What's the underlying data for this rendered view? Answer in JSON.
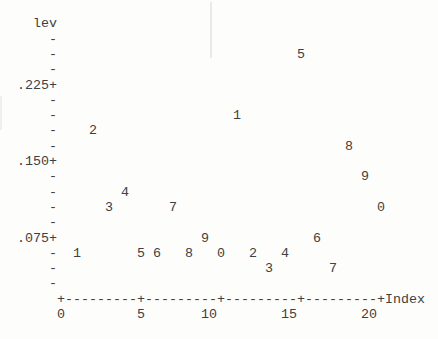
{
  "figure": {
    "background_color": "#fdfdfc",
    "text_color": "#404040"
  },
  "chart_data": {
    "type": "scatter",
    "plot_style": "minitab-character-plot",
    "title": "",
    "ylabel": "lev",
    "xlabel": "Index",
    "x": [
      1,
      2,
      3,
      4,
      5,
      6,
      7,
      8,
      9,
      10,
      11,
      12,
      13,
      14,
      15,
      16,
      17,
      18,
      19,
      20
    ],
    "y": [
      0.06,
      0.18,
      0.105,
      0.12,
      0.06,
      0.06,
      0.105,
      0.06,
      0.075,
      0.06,
      0.195,
      0.06,
      0.045,
      0.06,
      0.255,
      0.075,
      0.045,
      0.165,
      0.135,
      0.105
    ],
    "point_labels": [
      "1",
      "2",
      "3",
      "4",
      "5",
      "6",
      "7",
      "8",
      "9",
      "0",
      "1",
      "2",
      "3",
      "4",
      "5",
      "6",
      "7",
      "8",
      "9",
      "0"
    ],
    "y_ticks": [
      {
        "label": ".225",
        "value": 0.225
      },
      {
        "label": ".150",
        "value": 0.15
      },
      {
        "label": ".075",
        "value": 0.075
      }
    ],
    "y_resolution": 0.015,
    "x_ticks": [
      {
        "label": "0",
        "value": 0
      },
      {
        "label": "5",
        "value": 5
      },
      {
        "label": "10",
        "value": 10
      },
      {
        "label": "15",
        "value": 15
      },
      {
        "label": "20",
        "value": 20
      }
    ],
    "xlim": [
      0,
      20
    ],
    "ylim": [
      0.03,
      0.27
    ],
    "grid": false,
    "legend": null,
    "tick_glyph": "-",
    "axis_cross_glyph": "+",
    "axis_dash_glyph": "-"
  }
}
